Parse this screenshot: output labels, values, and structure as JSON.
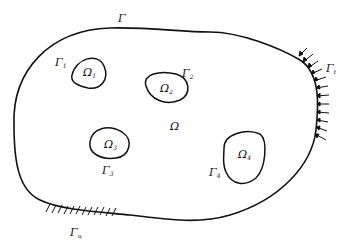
{
  "diagram": {
    "outer_boundary_label": "Γ",
    "domain_label": "Ω",
    "holes": [
      {
        "domain": "Ω",
        "domain_sub": "1",
        "boundary": "Γ",
        "boundary_sub": "1"
      },
      {
        "domain": "Ω",
        "domain_sub": "2",
        "boundary": "Γ",
        "boundary_sub": "2"
      },
      {
        "domain": "Ω",
        "domain_sub": "3",
        "boundary": "Γ",
        "boundary_sub": "3"
      },
      {
        "domain": "Ω",
        "domain_sub": "4",
        "boundary": "Γ",
        "boundary_sub": "4"
      }
    ],
    "traction_boundary": {
      "label": "Γ",
      "sub": "t"
    },
    "fixed_boundary": {
      "label": "Γ",
      "sub": "u"
    },
    "colors": {
      "stroke": "#111111",
      "background": "#ffffff"
    }
  }
}
